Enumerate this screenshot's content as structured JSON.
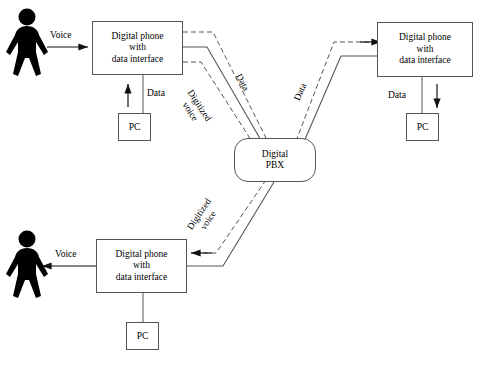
{
  "diagram": {
    "nodes": {
      "phone_top_left": {
        "line1": "Digital phone",
        "line2": "with",
        "line3": "data interface"
      },
      "phone_top_right": {
        "line1": "Digital phone",
        "line2": "with",
        "line3": "data interface"
      },
      "phone_bottom_left": {
        "line1": "Digital phone",
        "line2": "with",
        "line3": "data interface"
      },
      "pc_top_left": {
        "label": "PC"
      },
      "pc_top_right": {
        "label": "PC"
      },
      "pc_bottom_left": {
        "label": "PC"
      },
      "pbx": {
        "line1": "Digital",
        "line2": "PBX"
      }
    },
    "labels": {
      "voice_in": "Voice",
      "voice_out": "Voice",
      "data_pc_top_left": "Data",
      "data_pc_top_right": "Data",
      "data_left_trunk": "Data",
      "data_right_trunk": "Data",
      "digitized_voice_upper_line1": "Digitized",
      "digitized_voice_upper_line2": "voice",
      "digitized_voice_lower_line1": "Digitized",
      "digitized_voice_lower_line2": "voice"
    },
    "icons": {
      "person_top": "person-icon",
      "person_bottom": "person-icon"
    },
    "colors": {
      "line": "#555555",
      "arrow": "#111111",
      "person": "#000000",
      "background": "#ffffff"
    },
    "link_styles": {
      "digitized_voice": "dashed",
      "data": "dashed",
      "trunk": "solid"
    }
  }
}
